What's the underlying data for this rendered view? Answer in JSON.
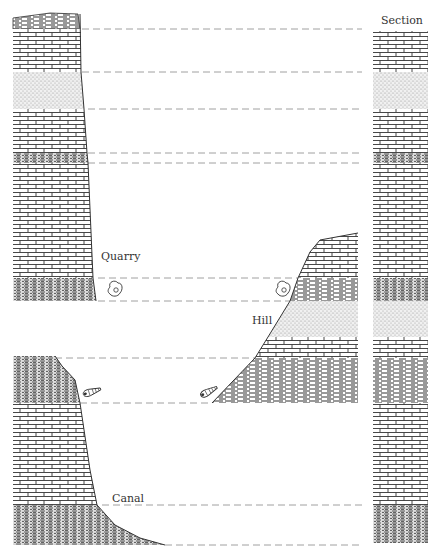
{
  "diagram": {
    "type": "geological-stratigraphic-correlation",
    "labels": {
      "section": "Section",
      "quarry": "Quarry",
      "hill": "Hill",
      "canal": "Canal"
    },
    "colors": {
      "ink": "#333333",
      "stipple": "#bdbdbd",
      "dash": "#888888",
      "background": "#ffffff"
    },
    "correlation_lines_y": [
      29,
      72,
      109,
      153,
      163,
      278,
      301,
      358,
      403,
      505,
      545
    ],
    "section_column": {
      "x": 373,
      "width": 55,
      "top": 31,
      "bottom": 543,
      "layers": [
        {
          "rock": "limestone",
          "top": 31,
          "bottom": 72
        },
        {
          "rock": "sandstone",
          "top": 72,
          "bottom": 109
        },
        {
          "rock": "limestone",
          "top": 109,
          "bottom": 153
        },
        {
          "rock": "shale",
          "top": 153,
          "bottom": 163
        },
        {
          "rock": "limestone",
          "top": 163,
          "bottom": 278
        },
        {
          "rock": "shale",
          "top": 278,
          "bottom": 301
        },
        {
          "rock": "sandstone",
          "top": 301,
          "bottom": 337
        },
        {
          "rock": "limestone",
          "top": 337,
          "bottom": 358
        },
        {
          "rock": "shale",
          "top": 358,
          "bottom": 403
        },
        {
          "rock": "limestone",
          "top": 403,
          "bottom": 505
        },
        {
          "rock": "dense-shale",
          "top": 505,
          "bottom": 543
        }
      ]
    },
    "outcrops": [
      {
        "name": "quarry",
        "label_pos": [
          118,
          284
        ]
      },
      {
        "name": "hill",
        "label_pos": [
          290,
          320
        ]
      },
      {
        "name": "canal",
        "label_pos": [
          112,
          506
        ]
      }
    ],
    "fossils": [
      {
        "kind": "ammonite",
        "x": 115,
        "y": 290
      },
      {
        "kind": "ammonite",
        "x": 283,
        "y": 290
      },
      {
        "kind": "gastropod",
        "x": 91,
        "y": 392
      },
      {
        "kind": "gastropod",
        "x": 208,
        "y": 392
      }
    ]
  }
}
